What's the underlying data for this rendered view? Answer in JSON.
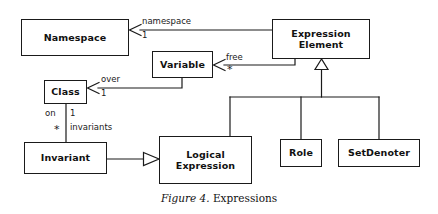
{
  "figure": {
    "caption_label": "Figure 4.",
    "caption_text": "Expressions"
  },
  "diagram": {
    "type": "uml-class-diagram",
    "stroke_color": "#1a1a1a",
    "background_color": "#ffffff",
    "classes": [
      {
        "id": "namespace",
        "name": "Namespace",
        "x": 21,
        "y": 19,
        "w": 108,
        "h": 37
      },
      {
        "id": "expression-element",
        "name": "Expression\nElement",
        "x": 272,
        "y": 19,
        "w": 98,
        "h": 40
      },
      {
        "id": "variable",
        "name": "Variable",
        "x": 152,
        "y": 51,
        "w": 61,
        "h": 27
      },
      {
        "id": "class",
        "name": "Class",
        "x": 44,
        "y": 80,
        "w": 43,
        "h": 24
      },
      {
        "id": "invariant",
        "name": "Invariant",
        "x": 24,
        "y": 142,
        "w": 83,
        "h": 32
      },
      {
        "id": "logical-expression",
        "name": "Logical\nExpression",
        "x": 159,
        "y": 136,
        "w": 93,
        "h": 48
      },
      {
        "id": "role",
        "name": "Role",
        "x": 280,
        "y": 139,
        "w": 42,
        "h": 28
      },
      {
        "id": "set-denoter",
        "name": "SetDenoter",
        "x": 338,
        "y": 139,
        "w": 82,
        "h": 28
      }
    ],
    "associations": [
      {
        "id": "namespace-assoc",
        "from": "expression-element",
        "to": "namespace",
        "role_label": "namespace",
        "multiplicity": "1",
        "arrow": "open"
      },
      {
        "id": "free-assoc",
        "from": "expression-element",
        "to": "variable",
        "role_label": "free",
        "multiplicity": "*",
        "arrow": "open"
      },
      {
        "id": "over-assoc",
        "from": "variable",
        "to": "class",
        "role_label": "over",
        "multiplicity": "1",
        "arrow": "open"
      },
      {
        "id": "invariants-assoc",
        "from": "class",
        "to": "invariant",
        "role_label_near": "on",
        "multiplicity_near": "1",
        "role_label_far": "invariants",
        "multiplicity_far": "*",
        "arrow": "none"
      }
    ],
    "generalizations": [
      {
        "id": "gen-expression-element",
        "parent": "expression-element",
        "children": [
          "logical-expression",
          "role",
          "set-denoter"
        ],
        "arrow": "hollow-triangle"
      },
      {
        "id": "gen-logical-expression",
        "parent": "logical-expression",
        "children": [
          "invariant"
        ],
        "arrow": "hollow-triangle"
      }
    ],
    "labels": {
      "namespace_role": "namespace",
      "namespace_mult": "1",
      "free_role": "free",
      "free_mult": "*",
      "over_role": "over",
      "over_mult": "1",
      "on_role": "on",
      "on_mult": "1",
      "invariants_role": "invariants",
      "invariants_mult": "*"
    }
  }
}
